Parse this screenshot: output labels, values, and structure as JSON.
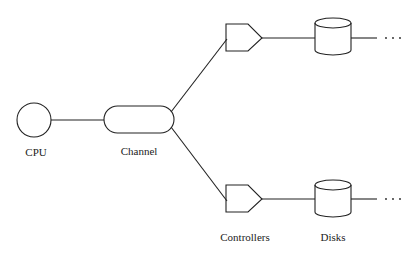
{
  "diagram": {
    "nodes": [
      {
        "id": "cpu",
        "label": "CPU",
        "shape": "circle"
      },
      {
        "id": "channel",
        "label": "Channel",
        "shape": "capsule"
      },
      {
        "id": "controller-top",
        "label": "",
        "shape": "pentagon"
      },
      {
        "id": "controller-bottom",
        "label": "Controllers",
        "shape": "pentagon"
      },
      {
        "id": "disk-top",
        "label": "",
        "shape": "cylinder"
      },
      {
        "id": "disk-bottom",
        "label": "Disks",
        "shape": "cylinder"
      }
    ],
    "edges": [
      [
        "cpu",
        "channel"
      ],
      [
        "channel",
        "controller-top"
      ],
      [
        "channel",
        "controller-bottom"
      ],
      [
        "controller-top",
        "disk-top"
      ],
      [
        "controller-bottom",
        "disk-bottom"
      ]
    ],
    "labels": {
      "cpu": "CPU",
      "channel": "Channel",
      "controllers": "Controllers",
      "disks": "Disks",
      "continuation": "· · ·"
    },
    "colors": {
      "stroke": "#222222",
      "background": "#ffffff"
    }
  }
}
